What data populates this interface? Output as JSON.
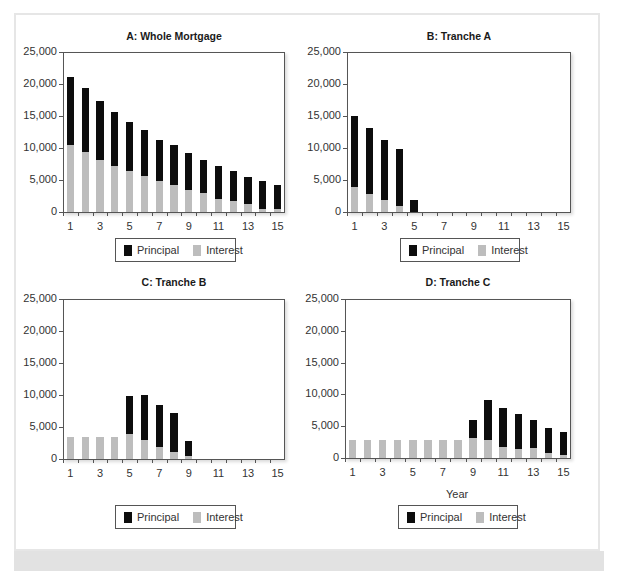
{
  "colors": {
    "principal": "#0d0d0d",
    "interest": "#bdbdbd",
    "axis": "#555555"
  },
  "legend": {
    "principal": "Principal",
    "interest": "Interest"
  },
  "chart_data": [
    {
      "type": "bar",
      "stacked": true,
      "title": "A: Whole Mortgage",
      "xlabel": "",
      "ylabel": "",
      "ylim": [
        0,
        25000
      ],
      "yticks": [
        "0",
        "5,000",
        "10,000",
        "15,000",
        "20,000",
        "25,000"
      ],
      "xticks": [
        "1",
        "3",
        "5",
        "7",
        "9",
        "11",
        "13",
        "15"
      ],
      "categories": [
        1,
        2,
        3,
        4,
        5,
        6,
        7,
        8,
        9,
        10,
        11,
        12,
        13,
        14,
        15
      ],
      "series": [
        {
          "name": "Interest",
          "values": [
            10400,
            9300,
            8200,
            7200,
            6400,
            5600,
            4800,
            4200,
            3500,
            2900,
            2100,
            1700,
            1300,
            500,
            500
          ]
        },
        {
          "name": "Principal",
          "values": [
            10700,
            10000,
            9200,
            8500,
            7700,
            7200,
            6500,
            6200,
            5700,
            5200,
            5100,
            4700,
            4200,
            4300,
            3700
          ]
        }
      ],
      "totals": [
        21100,
        19300,
        17400,
        15700,
        14100,
        12800,
        11300,
        10400,
        9200,
        8100,
        7200,
        6400,
        5500,
        4800,
        4200
      ],
      "legend_position": "bottom"
    },
    {
      "type": "bar",
      "stacked": true,
      "title": "B: Tranche A",
      "xlabel": "",
      "ylabel": "",
      "ylim": [
        0,
        25000
      ],
      "yticks": [
        "0",
        "5,000",
        "10,000",
        "15,000",
        "20,000",
        "25,000"
      ],
      "xticks": [
        "1",
        "3",
        "5",
        "7",
        "9",
        "11",
        "13",
        "15"
      ],
      "categories": [
        1,
        2,
        3,
        4,
        5,
        6,
        7,
        8,
        9,
        10,
        11,
        12,
        13,
        14,
        15
      ],
      "series": [
        {
          "name": "Interest",
          "values": [
            3900,
            2800,
            1800,
            1000,
            0,
            0,
            0,
            0,
            0,
            0,
            0,
            0,
            0,
            0,
            0
          ]
        },
        {
          "name": "Principal",
          "values": [
            11100,
            10300,
            9500,
            8900,
            1900,
            0,
            0,
            0,
            0,
            0,
            0,
            0,
            0,
            0,
            0
          ]
        }
      ],
      "totals": [
        15000,
        13100,
        11300,
        9900,
        1900,
        0,
        0,
        0,
        0,
        0,
        0,
        0,
        0,
        0,
        0
      ],
      "legend_position": "bottom"
    },
    {
      "type": "bar",
      "stacked": true,
      "title": "C: Tranche B",
      "xlabel": "",
      "ylabel": "",
      "ylim": [
        0,
        25000
      ],
      "yticks": [
        "0",
        "5,000",
        "10,000",
        "15,000",
        "20,000",
        "25,000"
      ],
      "xticks": [
        "1",
        "3",
        "5",
        "7",
        "9",
        "11",
        "13",
        "15"
      ],
      "categories": [
        1,
        2,
        3,
        4,
        5,
        6,
        7,
        8,
        9,
        10,
        11,
        12,
        13,
        14,
        15
      ],
      "series": [
        {
          "name": "Interest",
          "values": [
            3400,
            3400,
            3400,
            3400,
            3900,
            2900,
            1900,
            1100,
            500,
            0,
            0,
            0,
            0,
            0,
            0
          ]
        },
        {
          "name": "Principal",
          "values": [
            0,
            0,
            0,
            0,
            5900,
            7100,
            6500,
            6100,
            2300,
            0,
            0,
            0,
            0,
            0,
            0
          ]
        }
      ],
      "totals": [
        3400,
        3400,
        3400,
        3400,
        9800,
        10000,
        8400,
        7200,
        2800,
        0,
        0,
        0,
        0,
        0,
        0
      ],
      "legend_position": "bottom"
    },
    {
      "type": "bar",
      "stacked": true,
      "title": "D: Tranche C",
      "xlabel": "Year",
      "ylabel": "",
      "ylim": [
        0,
        25000
      ],
      "yticks": [
        "0",
        "5,000",
        "10,000",
        "15,000",
        "20,000",
        "25,000"
      ],
      "xticks": [
        "1",
        "3",
        "5",
        "7",
        "9",
        "11",
        "13",
        "15"
      ],
      "categories": [
        1,
        2,
        3,
        4,
        5,
        6,
        7,
        8,
        9,
        10,
        11,
        12,
        13,
        14,
        15
      ],
      "series": [
        {
          "name": "Interest",
          "values": [
            2900,
            2900,
            2900,
            2900,
            2900,
            2900,
            2900,
            2900,
            3100,
            2900,
            1700,
            1400,
            1500,
            800,
            500
          ]
        },
        {
          "name": "Principal",
          "values": [
            0,
            0,
            0,
            0,
            0,
            0,
            0,
            0,
            2900,
            6200,
            6200,
            5500,
            4400,
            3900,
            3600
          ]
        }
      ],
      "totals": [
        2900,
        2900,
        2900,
        2900,
        2900,
        2900,
        2900,
        2900,
        6000,
        9100,
        7900,
        6900,
        5900,
        4700,
        4100
      ],
      "legend_position": "bottom"
    }
  ]
}
